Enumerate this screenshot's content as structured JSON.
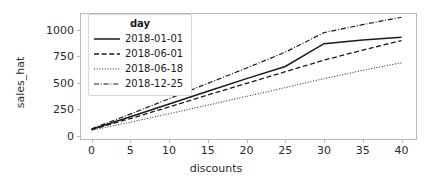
{
  "chart_data": {
    "type": "line",
    "title": "",
    "xlabel": "discounts",
    "ylabel": "sales_hat",
    "xlim": [
      -1.5,
      42
    ],
    "ylim": [
      -40,
      1160
    ],
    "xticks": [
      0,
      5,
      10,
      15,
      20,
      25,
      30,
      35,
      40
    ],
    "xticklabels": [
      "0",
      "5",
      "10",
      "15",
      "20",
      "25",
      "30",
      "35",
      "40"
    ],
    "yticks": [
      0,
      250,
      500,
      750,
      1000
    ],
    "yticklabels": [
      "0",
      "250",
      "500",
      "750",
      "1000"
    ],
    "grid": false,
    "legend": {
      "title": "day",
      "position": "upper left",
      "entries": [
        {
          "label": "2018-01-01",
          "style": "solid"
        },
        {
          "label": "2018-06-01",
          "style": "dashed"
        },
        {
          "label": "2018-06-18",
          "style": "dotted"
        },
        {
          "label": "2018-12-25",
          "style": "dashdot"
        }
      ]
    },
    "x": [
      0,
      5,
      10,
      15,
      20,
      25,
      30,
      35,
      40
    ],
    "series": [
      {
        "name": "2018-01-01",
        "style": "solid",
        "values": [
          62,
          180,
          300,
          420,
          540,
          655,
          870,
          905,
          930
        ]
      },
      {
        "name": "2018-06-01",
        "style": "dashed",
        "values": [
          58,
          163,
          272,
          385,
          495,
          605,
          715,
          810,
          900
        ]
      },
      {
        "name": "2018-06-18",
        "style": "dotted",
        "values": [
          52,
          128,
          208,
          290,
          372,
          455,
          540,
          618,
          690
        ]
      },
      {
        "name": "2018-12-25",
        "style": "dashdot",
        "values": [
          66,
          205,
          350,
          495,
          640,
          790,
          975,
          1050,
          1120
        ]
      }
    ]
  },
  "colors": {
    "line": "#1a1a1a",
    "axis": "#b9b9b9",
    "text": "#2b2b2b",
    "background": "#ffffff"
  }
}
